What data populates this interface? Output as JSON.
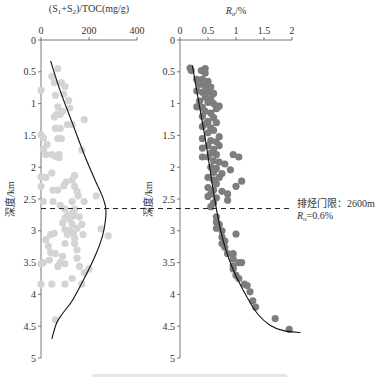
{
  "chart_data": [
    {
      "type": "scatter",
      "title": "(S1+S2)/TOC(mg/g)",
      "xlabel": "(S1+S2)/TOC(mg/g)",
      "ylabel": "深度/km",
      "xlim": [
        0,
        400
      ],
      "ylim": [
        0,
        5
      ],
      "xticks": [
        0,
        200,
        400
      ],
      "yticks": [
        0,
        0.5,
        1,
        1.5,
        2,
        2.5,
        3,
        3.5,
        4,
        4.5,
        5
      ],
      "point_color": "#d4d4d4",
      "points": [
        [
          70,
          0.45
        ],
        [
          45,
          0.57
        ],
        [
          55,
          0.67
        ],
        [
          85,
          0.67
        ],
        [
          100,
          0.73
        ],
        [
          0,
          0.79
        ],
        [
          60,
          0.87
        ],
        [
          95,
          0.85
        ],
        [
          115,
          0.95
        ],
        [
          70,
          1.05
        ],
        [
          120,
          1.07
        ],
        [
          90,
          1.12
        ],
        [
          65,
          1.17
        ],
        [
          80,
          1.17
        ],
        [
          55,
          1.21
        ],
        [
          180,
          1.25
        ],
        [
          110,
          1.33
        ],
        [
          130,
          1.33
        ],
        [
          60,
          1.39
        ],
        [
          80,
          1.39
        ],
        [
          0,
          1.49
        ],
        [
          10,
          1.54
        ],
        [
          70,
          1.55
        ],
        [
          85,
          1.55
        ],
        [
          25,
          1.64
        ],
        [
          170,
          1.73
        ],
        [
          10,
          1.72
        ],
        [
          20,
          1.8
        ],
        [
          45,
          1.8
        ],
        [
          75,
          1.8
        ],
        [
          60,
          1.83
        ],
        [
          75,
          1.85
        ],
        [
          0,
          2.15
        ],
        [
          45,
          2.09
        ],
        [
          20,
          2.16
        ],
        [
          140,
          2.13
        ],
        [
          130,
          2.2
        ],
        [
          105,
          2.23
        ],
        [
          95,
          2.29
        ],
        [
          0,
          2.3
        ],
        [
          140,
          2.3
        ],
        [
          50,
          2.36
        ],
        [
          70,
          2.36
        ],
        [
          150,
          2.38
        ],
        [
          155,
          2.45
        ],
        [
          230,
          2.45
        ],
        [
          10,
          2.54
        ],
        [
          50,
          2.54
        ],
        [
          130,
          2.54
        ],
        [
          180,
          2.54
        ],
        [
          80,
          2.6
        ],
        [
          100,
          2.66
        ],
        [
          140,
          2.66
        ],
        [
          130,
          2.72
        ],
        [
          110,
          2.76
        ],
        [
          140,
          2.76
        ],
        [
          160,
          2.78
        ],
        [
          120,
          2.82
        ],
        [
          100,
          2.8
        ],
        [
          90,
          2.88
        ],
        [
          130,
          2.9
        ],
        [
          170,
          2.9
        ],
        [
          150,
          2.96
        ],
        [
          100,
          2.98
        ],
        [
          120,
          3.0
        ],
        [
          250,
          2.97
        ],
        [
          135,
          3.04
        ],
        [
          55,
          3.04
        ],
        [
          40,
          3.06
        ],
        [
          110,
          3.06
        ],
        [
          175,
          3.06
        ],
        [
          280,
          3.08
        ],
        [
          140,
          3.12
        ],
        [
          20,
          3.14
        ],
        [
          100,
          3.2
        ],
        [
          140,
          3.2
        ],
        [
          30,
          3.24
        ],
        [
          150,
          3.3
        ],
        [
          40,
          3.34
        ],
        [
          60,
          3.36
        ],
        [
          90,
          3.4
        ],
        [
          150,
          3.43
        ],
        [
          35,
          3.46
        ],
        [
          80,
          3.5
        ],
        [
          0,
          3.52
        ],
        [
          10,
          3.5
        ],
        [
          100,
          3.52
        ],
        [
          70,
          3.56
        ],
        [
          160,
          3.56
        ],
        [
          200,
          3.6
        ],
        [
          180,
          3.66
        ],
        [
          130,
          3.75
        ],
        [
          0,
          3.84
        ],
        [
          45,
          3.84
        ],
        [
          100,
          3.84
        ],
        [
          170,
          3.84
        ],
        [
          60,
          4.4
        ]
      ],
      "fit_curve": [
        [
          40,
          0.33
        ],
        [
          80,
          0.8
        ],
        [
          130,
          1.3
        ],
        [
          180,
          1.8
        ],
        [
          225,
          2.2
        ],
        [
          255,
          2.45
        ],
        [
          270,
          2.65
        ],
        [
          268,
          2.85
        ],
        [
          255,
          3.1
        ],
        [
          225,
          3.4
        ],
        [
          180,
          3.75
        ],
        [
          130,
          4.1
        ],
        [
          90,
          4.3
        ],
        [
          65,
          4.45
        ],
        [
          45,
          4.7
        ]
      ]
    },
    {
      "type": "scatter",
      "title": "Ro/%",
      "xlabel": "Ro/%",
      "ylabel": "深度/km",
      "xlim": [
        0,
        2
      ],
      "ylim": [
        0,
        5
      ],
      "xticks": [
        0,
        0.5,
        1,
        1.5,
        2
      ],
      "yticks": [
        0,
        0.5,
        1,
        1.5,
        2,
        2.5,
        3,
        3.5,
        4,
        4.5,
        5
      ],
      "point_color": "#7d7d7d",
      "points": [
        [
          0.18,
          0.44
        ],
        [
          0.2,
          0.48
        ],
        [
          0.45,
          0.45
        ],
        [
          0.38,
          0.48
        ],
        [
          0.45,
          0.52
        ],
        [
          0.3,
          0.62
        ],
        [
          0.4,
          0.62
        ],
        [
          0.5,
          0.65
        ],
        [
          0.35,
          0.7
        ],
        [
          0.45,
          0.72
        ],
        [
          0.55,
          0.74
        ],
        [
          0.3,
          0.8
        ],
        [
          0.4,
          0.82
        ],
        [
          0.5,
          0.82
        ],
        [
          0.6,
          0.84
        ],
        [
          0.45,
          0.9
        ],
        [
          0.55,
          0.92
        ],
        [
          0.35,
          0.96
        ],
        [
          0.5,
          0.98
        ],
        [
          0.6,
          1.0
        ],
        [
          0.7,
          1.04
        ],
        [
          0.3,
          1.05
        ],
        [
          0.4,
          1.06
        ],
        [
          0.65,
          1.08
        ],
        [
          0.45,
          1.12
        ],
        [
          0.55,
          1.15
        ],
        [
          0.4,
          1.2
        ],
        [
          0.6,
          1.22
        ],
        [
          0.5,
          1.28
        ],
        [
          0.45,
          1.32
        ],
        [
          0.65,
          1.3
        ],
        [
          0.4,
          1.36
        ],
        [
          0.55,
          1.38
        ],
        [
          0.6,
          1.42
        ],
        [
          0.5,
          1.46
        ],
        [
          0.7,
          1.52
        ],
        [
          0.4,
          1.55
        ],
        [
          0.55,
          1.58
        ],
        [
          0.65,
          1.6
        ],
        [
          0.5,
          1.66
        ],
        [
          0.7,
          1.66
        ],
        [
          0.4,
          1.7
        ],
        [
          0.6,
          1.72
        ],
        [
          0.55,
          1.78
        ],
        [
          0.65,
          1.8
        ],
        [
          0.95,
          1.8
        ],
        [
          0.4,
          1.84
        ],
        [
          0.5,
          1.84
        ],
        [
          1.05,
          1.84
        ],
        [
          0.6,
          1.9
        ],
        [
          0.7,
          1.92
        ],
        [
          0.8,
          1.95
        ],
        [
          0.55,
          2.0
        ],
        [
          0.65,
          2.02
        ],
        [
          0.9,
          2.04
        ],
        [
          0.6,
          2.08
        ],
        [
          0.75,
          2.1
        ],
        [
          0.5,
          2.16
        ],
        [
          0.7,
          2.16
        ],
        [
          0.6,
          2.2
        ],
        [
          1.1,
          2.22
        ],
        [
          0.65,
          2.26
        ],
        [
          1.0,
          2.3
        ],
        [
          0.5,
          2.32
        ],
        [
          0.6,
          2.36
        ],
        [
          0.75,
          2.38
        ],
        [
          0.55,
          2.42
        ],
        [
          0.85,
          2.42
        ],
        [
          0.5,
          2.46
        ],
        [
          0.65,
          2.48
        ],
        [
          0.85,
          2.52
        ],
        [
          0.6,
          2.56
        ],
        [
          0.55,
          2.62
        ],
        [
          0.65,
          2.78
        ],
        [
          0.65,
          2.86
        ],
        [
          0.7,
          2.9
        ],
        [
          0.65,
          2.96
        ],
        [
          0.75,
          3.0
        ],
        [
          1.0,
          3.05
        ],
        [
          0.75,
          3.1
        ],
        [
          0.8,
          3.16
        ],
        [
          0.75,
          3.2
        ],
        [
          0.8,
          3.26
        ],
        [
          0.85,
          3.36
        ],
        [
          0.95,
          3.36
        ],
        [
          0.95,
          3.44
        ],
        [
          1.05,
          3.5
        ],
        [
          1.1,
          3.5
        ],
        [
          0.95,
          3.55
        ],
        [
          0.95,
          3.6
        ],
        [
          1.0,
          3.7
        ],
        [
          1.05,
          3.75
        ],
        [
          1.15,
          3.84
        ],
        [
          1.2,
          3.86
        ],
        [
          1.25,
          3.96
        ],
        [
          1.3,
          4.1
        ],
        [
          1.35,
          4.2
        ],
        [
          1.7,
          4.38
        ],
        [
          1.95,
          4.55
        ]
      ],
      "fit_curve": [
        [
          0.22,
          0.4
        ],
        [
          0.3,
          0.8
        ],
        [
          0.38,
          1.2
        ],
        [
          0.46,
          1.6
        ],
        [
          0.53,
          2.0
        ],
        [
          0.6,
          2.4
        ],
        [
          0.67,
          2.75
        ],
        [
          0.74,
          3.05
        ],
        [
          0.82,
          3.3
        ],
        [
          0.92,
          3.55
        ],
        [
          1.05,
          3.8
        ],
        [
          1.2,
          4.05
        ],
        [
          1.38,
          4.3
        ],
        [
          1.6,
          4.48
        ],
        [
          1.85,
          4.57
        ],
        [
          2.15,
          4.6
        ]
      ]
    }
  ],
  "annotation": {
    "threshold_depth_km": 2.65,
    "line1": "排烃门限：2600m",
    "line2_prefix": "R",
    "line2_sub": "o",
    "line2_suffix": "=0.6%"
  },
  "left_panel": {
    "title_parts": [
      "(S",
      "1",
      "+S",
      "2",
      ")/TOC(mg/g)"
    ],
    "ylabel": "深度/km",
    "xtick_labels": [
      "0",
      "200",
      "400"
    ]
  },
  "right_panel": {
    "title_main": "R",
    "title_sub": "o",
    "title_suffix": "/%",
    "ylabel": "深度/km",
    "xtick_labels": [
      "0",
      "0.5",
      "1",
      "1.5",
      "2"
    ]
  },
  "ytick_labels": [
    "0",
    "0.5",
    "1",
    "1.5",
    "2",
    "2.5",
    "3",
    "3.5",
    "4",
    "4.5",
    "5"
  ],
  "colors": {
    "left_points": "#d4d4d4",
    "right_points": "#7d7d7d",
    "axis": "#555555",
    "curve": "#111111"
  }
}
